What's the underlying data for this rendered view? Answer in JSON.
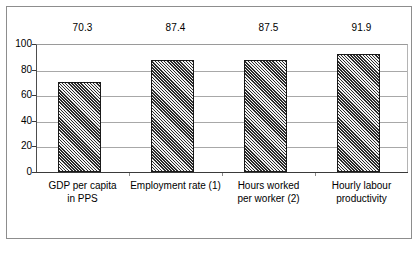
{
  "chart_data": {
    "type": "bar",
    "title": "",
    "subtitle": "",
    "xlabel": "",
    "ylabel": "",
    "ylim": [
      0,
      100
    ],
    "yticks": [
      0,
      20,
      40,
      60,
      80,
      100
    ],
    "grid": true,
    "legend": false,
    "legend_position": "none",
    "categories": [
      "GDP per capita in PPS",
      "Employment rate (1)",
      "Hours worked per worker (2)",
      "Hourly labour productivity"
    ],
    "category_lines": [
      [
        "GDP per capita",
        "in PPS"
      ],
      [
        "Employment rate (1)",
        ""
      ],
      [
        "Hours worked",
        "per worker (2)"
      ],
      [
        "Hourly labour",
        "productivity"
      ]
    ],
    "values": [
      70.3,
      87.4,
      87.5,
      91.9
    ],
    "value_labels": [
      "70.3",
      "87.4",
      "87.5",
      "91.9"
    ],
    "series": [
      {
        "name": "",
        "values": [
          70.3,
          87.4,
          87.5,
          91.9
        ]
      }
    ]
  },
  "axis": {
    "y_tick_labels": [
      "100",
      "80",
      "60",
      "40",
      "20",
      "0"
    ]
  },
  "style": {
    "bar_hatch_dark": "#2b2b2b",
    "bar_hatch_light": "#f2f2f2",
    "bar_outline": "#1a1a1a",
    "gridline_color": "#a8a8a8",
    "axis_color": "#3a3a3a",
    "frame_color": "#8d8d8d",
    "background": "#ffffff",
    "text_color": "#000000"
  }
}
